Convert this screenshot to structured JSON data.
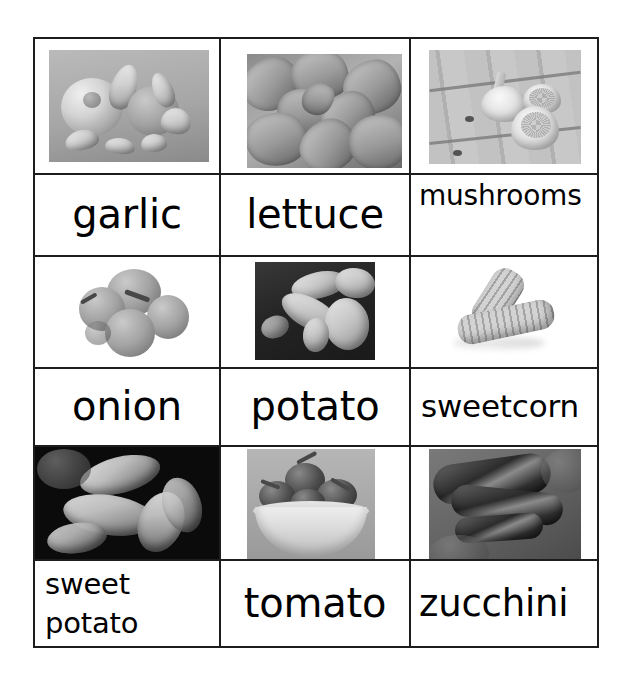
{
  "page": {
    "kind": "vegetable-vocabulary-flashcard-grid",
    "background_color": "#ffffff",
    "border_color": "#1d1d1d",
    "columns": 3,
    "rows": 3
  },
  "cards": [
    {
      "label": "garlic",
      "image_name": "garlic-photo",
      "image_alt": "black and white photo of a garlic bulb and separated cloves",
      "label_align": "center"
    },
    {
      "label": "lettuce",
      "image_name": "lettuce-photo",
      "image_alt": "black and white close-up photo of a lettuce head leaves",
      "label_align": "center"
    },
    {
      "label": "mushrooms",
      "image_name": "mushrooms-photo",
      "image_alt": "black and white photo of button mushrooms on a wooden board",
      "label_align": "left-top"
    },
    {
      "label": "onion",
      "image_name": "onion-photo",
      "image_alt": "black and white photo of a pile of onions on white background",
      "label_align": "center"
    },
    {
      "label": "potato",
      "image_name": "potato-photo",
      "image_alt": "black and white photo of potatoes lying in dark soil",
      "label_align": "center"
    },
    {
      "label": "sweetcorn",
      "image_name": "sweetcorn-photo",
      "image_alt": "black and white photo of two corn cobs on white background",
      "label_align": "left-mid"
    },
    {
      "label": "sweet potato",
      "label_line_1": "sweet",
      "label_line_2": "potato",
      "image_name": "sweet-potato-photo",
      "image_alt": "black and white photo of sweet potatoes on a dark background",
      "label_align": "two-line-left"
    },
    {
      "label": "tomato",
      "image_name": "tomato-photo",
      "image_alt": "black and white photo of tomatoes in a white bowl",
      "label_align": "center"
    },
    {
      "label": "zucchini",
      "image_name": "zucchini-photo",
      "image_alt": "black and white photo of three zucchini courgettes on soil",
      "label_align": "left-big"
    }
  ]
}
